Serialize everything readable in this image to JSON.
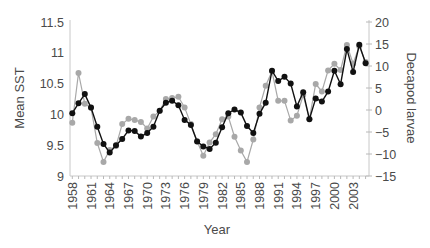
{
  "chart_data": {
    "type": "line",
    "title": "",
    "xlabel": "Year",
    "ylabel": "Mean SST",
    "ylabel_right": "Decapod larvae",
    "x": [
      1958,
      1959,
      1960,
      1961,
      1962,
      1963,
      1964,
      1965,
      1966,
      1967,
      1968,
      1969,
      1970,
      1971,
      1972,
      1973,
      1974,
      1975,
      1976,
      1977,
      1978,
      1979,
      1980,
      1981,
      1982,
      1983,
      1984,
      1985,
      1986,
      1987,
      1988,
      1989,
      1990,
      1991,
      1992,
      1993,
      1994,
      1995,
      1996,
      1997,
      1998,
      1999,
      2000,
      2001,
      2002,
      2003,
      2004,
      2005
    ],
    "x_tick_labels": [
      "1958",
      "1961",
      "1964",
      "1967",
      "1970",
      "1973",
      "1976",
      "1979",
      "1982",
      "1985",
      "1988",
      "1991",
      "1994",
      "1997",
      "2000",
      "2003"
    ],
    "ylim": [
      9,
      11.5
    ],
    "y_ticks": [
      "9",
      "9.5",
      "10",
      "10.5",
      "11",
      "11.5"
    ],
    "ylim_right": [
      -15,
      20
    ],
    "y_ticks_right": [
      "-15",
      "-10",
      "-5",
      "0",
      "5",
      "10",
      "15",
      "20"
    ],
    "grid": false,
    "legend": null,
    "series": [
      {
        "name": "Mean SST",
        "axis": "left",
        "color": "#111111",
        "values": [
          10.02,
          10.18,
          10.33,
          10.11,
          9.8,
          9.52,
          9.38,
          9.5,
          9.6,
          9.74,
          9.73,
          9.64,
          9.7,
          9.8,
          10.06,
          10.19,
          10.22,
          10.15,
          9.91,
          9.83,
          9.56,
          9.48,
          9.44,
          9.54,
          9.79,
          10.02,
          10.08,
          10.03,
          9.81,
          9.7,
          10.01,
          10.19,
          10.71,
          10.54,
          10.61,
          10.5,
          10.13,
          10.36,
          9.92,
          10.26,
          10.21,
          10.37,
          10.71,
          10.49,
          11.06,
          10.69,
          11.13,
          10.83
        ]
      },
      {
        "name": "Decapod larvae",
        "axis": "right",
        "color": "#a8a8a8",
        "values": [
          -2.9,
          8.4,
          1.4,
          0.5,
          -7.5,
          -11.8,
          -9.1,
          -8.2,
          -3.2,
          -2.0,
          -2.3,
          -2.7,
          -4.2,
          -1.5,
          -0.2,
          2.5,
          2.7,
          3.0,
          0.6,
          -3.2,
          -7.1,
          -10.4,
          -7.4,
          -5.5,
          -2.1,
          -1.5,
          -6.1,
          -9.2,
          -11.8,
          -6.7,
          0.6,
          5.5,
          8.8,
          2.1,
          2.1,
          -2.4,
          -1.3,
          3.4,
          -2.0,
          5.9,
          4.2,
          9.0,
          10.5,
          9.1,
          14.8,
          10.5,
          14.5,
          10.9
        ]
      }
    ]
  }
}
